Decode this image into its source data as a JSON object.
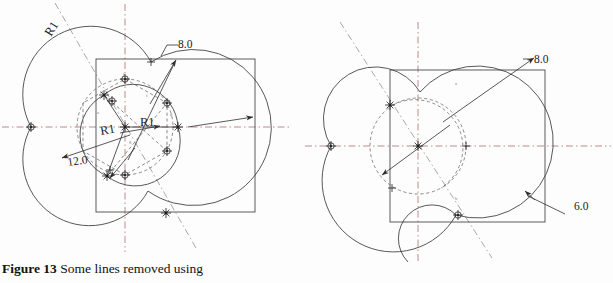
{
  "caption": {
    "figure_label": "Figure 13",
    "text": " Some lines removed using"
  },
  "figures": [
    {
      "id": "left-diagram",
      "name": "construction-diagram-left",
      "dimensions": [
        {
          "name": "dim-8-0",
          "value": "8.0",
          "x": 178,
          "y": 48
        },
        {
          "name": "dim-12-0",
          "value": "12.0",
          "x": 68,
          "y": 166
        }
      ],
      "radius_labels": [
        {
          "name": "radius-label-upper-left",
          "value": "R1",
          "x": 51,
          "y": 37,
          "rotate": -58
        },
        {
          "name": "radius-label-center-left",
          "value": "R1",
          "x": 101,
          "y": 135,
          "rotate": -10
        },
        {
          "name": "radius-label-center-right",
          "value": "R1",
          "x": 140,
          "y": 126,
          "rotate": 0
        }
      ],
      "tiny_marks": [
        {
          "name": "vertex-tag-a",
          "value": "a",
          "x": 97,
          "y": 114
        },
        {
          "name": "vertex-tag-b",
          "value": "b",
          "x": 123,
          "y": 76
        },
        {
          "name": "vertex-tag-c",
          "value": "c",
          "x": 124,
          "y": 186
        },
        {
          "name": "vertex-tag-d",
          "value": "d",
          "x": 170,
          "y": 116
        },
        {
          "name": "vertex-tag-e",
          "value": "e",
          "x": 170,
          "y": 152
        },
        {
          "name": "vertex-tag-f",
          "value": "f",
          "x": 146,
          "y": 97
        },
        {
          "name": "vertex-tag-g",
          "value": "g",
          "x": 129,
          "y": 143
        }
      ]
    },
    {
      "id": "right-diagram",
      "name": "construction-diagram-right",
      "dimensions": [
        {
          "name": "dim-8-0",
          "value": "8.0",
          "x": 534,
          "y": 63
        },
        {
          "name": "dim-6-0",
          "value": "6.0",
          "x": 574,
          "y": 210
        }
      ],
      "radius_labels": [],
      "tiny_marks": [
        {
          "name": "vertex-tag-a",
          "value": "a",
          "x": 455,
          "y": 85
        },
        {
          "name": "vertex-tag-b",
          "value": "b",
          "x": 455,
          "y": 200
        }
      ]
    }
  ],
  "colors": {
    "object_line": "#3a3a3a",
    "square_line": "#4a4a4a",
    "centerline": "#8b2f2f",
    "construction": "#5a5a5a",
    "text": "#1b1b1b",
    "background": "#fdfdfd"
  }
}
